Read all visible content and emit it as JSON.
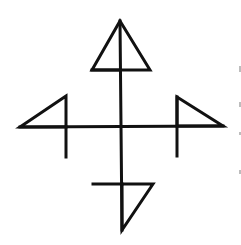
{
  "diagram": {
    "title": "",
    "stroke_color": "#111111",
    "background_color": "#ffffff",
    "stroke_width": 3,
    "cross": {
      "vertical": {
        "x1": 120,
        "y1": 21,
        "x2": 122,
        "y2": 230
      },
      "horizontal": {
        "x1": 20,
        "y1": 127,
        "x2": 223,
        "y2": 126
      }
    },
    "flags": [
      {
        "name": "top",
        "points": "120,21 150,70 92,70",
        "stub": {
          "x1": 92,
          "y1": 70,
          "x2": 120,
          "y2": 70
        }
      },
      {
        "name": "left",
        "points": "66,96 20,127 66,127",
        "stub": {
          "x1": 66,
          "y1": 127,
          "x2": 66,
          "y2": 157
        }
      },
      {
        "name": "right",
        "points": "177,97 223,126 177,126",
        "stub": {
          "x1": 177,
          "y1": 97,
          "x2": 177,
          "y2": 156
        }
      },
      {
        "name": "bottom",
        "points": "153,184 122,230 122,184",
        "stub": {
          "x1": 93,
          "y1": 184,
          "x2": 122,
          "y2": 184
        }
      }
    ]
  }
}
